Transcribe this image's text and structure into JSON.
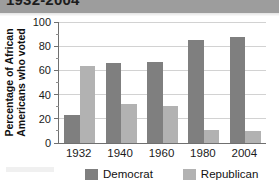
{
  "header": {
    "title": "1932-2004"
  },
  "chart_data": {
    "type": "bar",
    "title": "1932-2004",
    "xlabel": "",
    "ylabel": "Percentage of African Americans who voted",
    "ylabel_line1": "Percentage of African",
    "ylabel_line2": "Americans who voted",
    "categories": [
      "1932",
      "1940",
      "1960",
      "1980",
      "2004"
    ],
    "ylim": [
      0,
      100
    ],
    "yticks": [
      0,
      20,
      40,
      60,
      80,
      100
    ],
    "ytick_labels": [
      "0",
      "20",
      "40",
      "60",
      "80",
      "100"
    ],
    "grid": true,
    "legend_position": "bottom",
    "series": [
      {
        "name": "Democrat",
        "color": "#7f7f7f",
        "values": [
          23,
          66,
          67,
          85,
          88
        ]
      },
      {
        "name": "Republican",
        "color": "#b2b2b2",
        "values": [
          64,
          32,
          31,
          11,
          10
        ]
      }
    ]
  },
  "legend": {
    "democrat_label": "Democrat",
    "republican_label": "Republican"
  },
  "colors": {
    "democrat": "#7f7f7f",
    "republican": "#b2b2b2",
    "axis": "#6f6f6f",
    "grid": "#d2d2d2",
    "header_band": "#9d9d9d",
    "background": "#ffffff"
  }
}
